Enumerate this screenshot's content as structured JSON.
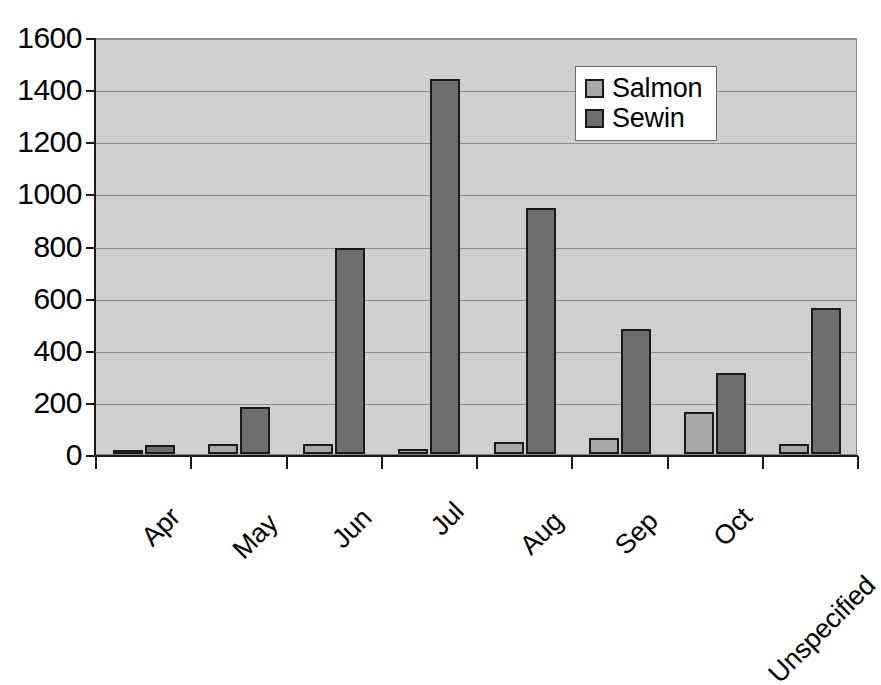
{
  "chart_data": {
    "type": "bar",
    "title": "",
    "xlabel": "",
    "ylabel": "",
    "grid": true,
    "legend_position": "inside-top-right",
    "ylim": [
      0,
      1600
    ],
    "yticks": [
      0,
      200,
      400,
      600,
      800,
      1000,
      1200,
      1400,
      1600
    ],
    "ytick_labels": [
      "0",
      "200",
      "400",
      "600",
      "800",
      "1000",
      "1200",
      "1400",
      "1600"
    ],
    "categories": [
      "Apr",
      "May",
      "Jun",
      "Jul",
      "Aug",
      "Sep",
      "Oct",
      "Unspecified"
    ],
    "series": [
      {
        "name": "Salmon",
        "color": "#a8a8a8",
        "values": [
          8,
          38,
          40,
          20,
          48,
          62,
          160,
          40
        ]
      },
      {
        "name": "Sewin",
        "color": "#6e6e6e",
        "values": [
          35,
          180,
          790,
          1440,
          945,
          480,
          310,
          560
        ]
      }
    ]
  },
  "legend": {
    "items": [
      {
        "label": "Salmon",
        "swatch": "salmon-swatch-icon"
      },
      {
        "label": "Sewin",
        "swatch": "sewin-swatch-icon"
      }
    ]
  },
  "colors": {
    "plot_background": "#cfcfcf",
    "plot_border": "#8a8a8a",
    "gridline": "#8f8f8f",
    "axis": "#1a1a1a",
    "salmon": "#a8a8a8",
    "sewin": "#6e6e6e",
    "page_background": "#ffffff"
  }
}
